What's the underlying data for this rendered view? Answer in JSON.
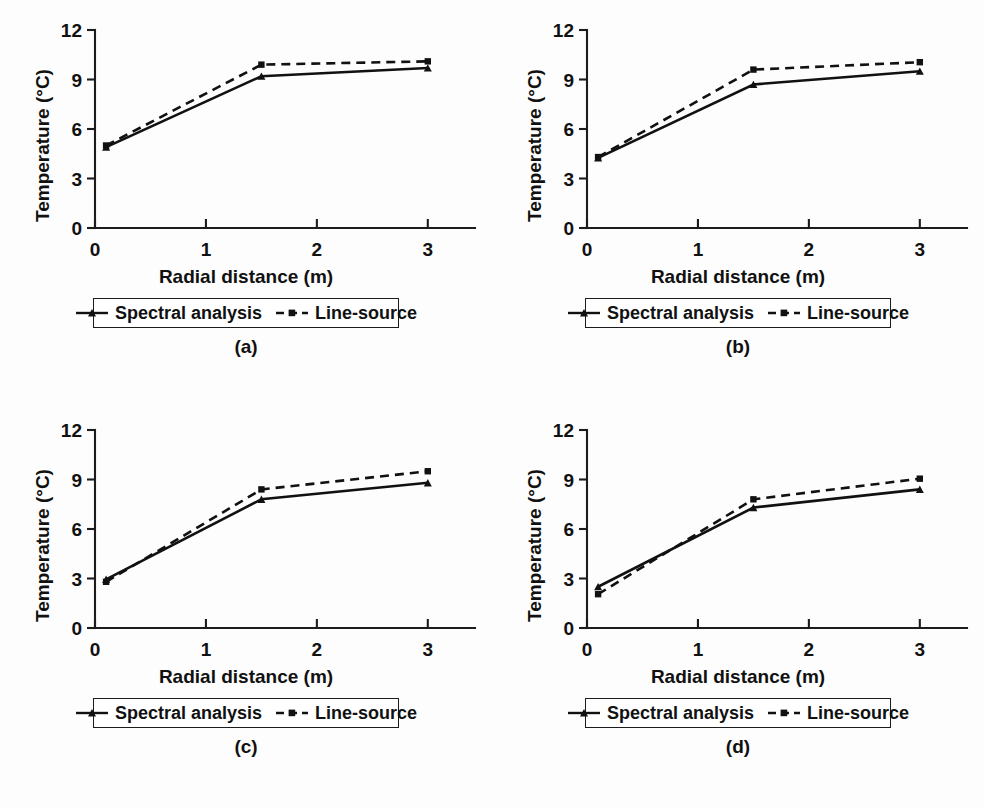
{
  "figure": {
    "background_color": "#fdfdfd",
    "ink_color": "#111111",
    "caption_fragment": ""
  },
  "common": {
    "xlabel": "Radial distance (m)",
    "ylabel": "Temperature (°C)",
    "xticks": [
      "0",
      "1",
      "2",
      "3"
    ],
    "yticks": [
      "0",
      "3",
      "6",
      "9",
      "12"
    ],
    "legend": {
      "spectral_label": "Spectral analysis",
      "line_source_label": "Line-source"
    }
  },
  "panels": [
    {
      "id": "a",
      "caption": "(a)"
    },
    {
      "id": "b",
      "caption": "(b)"
    },
    {
      "id": "c",
      "caption": "(c)"
    },
    {
      "id": "d",
      "caption": "(d)"
    }
  ],
  "chart_data": [
    {
      "type": "line",
      "title": "(a)",
      "xlabel": "Radial distance (m)",
      "ylabel": "Temperature (°C)",
      "xlim": [
        0,
        3.2
      ],
      "ylim": [
        0,
        12
      ],
      "xticks": [
        0,
        1,
        2,
        3
      ],
      "yticks": [
        0,
        3,
        6,
        9,
        12
      ],
      "grid": false,
      "legend_position": "below-axes",
      "x": [
        0.1,
        1.5,
        3.0
      ],
      "series": [
        {
          "name": "Spectral analysis",
          "style": "solid",
          "values": [
            4.9,
            9.2,
            9.7
          ]
        },
        {
          "name": "Line-source",
          "style": "dashed",
          "values": [
            5.0,
            9.9,
            10.1
          ]
        }
      ]
    },
    {
      "type": "line",
      "title": "(b)",
      "xlabel": "Radial distance (m)",
      "ylabel": "Temperature (°C)",
      "xlim": [
        0,
        3.2
      ],
      "ylim": [
        0,
        12
      ],
      "xticks": [
        0,
        1,
        2,
        3
      ],
      "yticks": [
        0,
        3,
        6,
        9,
        12
      ],
      "grid": false,
      "legend_position": "below-axes",
      "x": [
        0.1,
        1.5,
        3.0
      ],
      "series": [
        {
          "name": "Spectral analysis",
          "style": "solid",
          "values": [
            4.25,
            8.7,
            9.5
          ]
        },
        {
          "name": "Line-source",
          "style": "dashed",
          "values": [
            4.3,
            9.6,
            10.05
          ]
        }
      ]
    },
    {
      "type": "line",
      "title": "(c)",
      "xlabel": "Radial distance (m)",
      "ylabel": "Temperature (°C)",
      "xlim": [
        0,
        3.2
      ],
      "ylim": [
        0,
        12
      ],
      "xticks": [
        0,
        1,
        2,
        3
      ],
      "yticks": [
        0,
        3,
        6,
        9,
        12
      ],
      "grid": false,
      "legend_position": "below-axes",
      "x": [
        0.1,
        1.5,
        3.0
      ],
      "series": [
        {
          "name": "Spectral analysis",
          "style": "solid",
          "values": [
            2.95,
            7.8,
            8.8
          ]
        },
        {
          "name": "Line-source",
          "style": "dashed",
          "values": [
            2.8,
            8.4,
            9.5
          ]
        }
      ]
    },
    {
      "type": "line",
      "title": "(d)",
      "xlabel": "Radial distance (m)",
      "ylabel": "Temperature (°C)",
      "xlim": [
        0,
        3.2
      ],
      "ylim": [
        0,
        12
      ],
      "xticks": [
        0,
        1,
        2,
        3
      ],
      "yticks": [
        0,
        3,
        6,
        9,
        12
      ],
      "grid": false,
      "legend_position": "below-axes",
      "x": [
        0.1,
        1.5,
        3.0
      ],
      "series": [
        {
          "name": "Spectral analysis",
          "style": "solid",
          "values": [
            2.5,
            7.3,
            8.4
          ]
        },
        {
          "name": "Line-source",
          "style": "dashed",
          "values": [
            2.05,
            7.8,
            9.05
          ]
        }
      ]
    }
  ]
}
